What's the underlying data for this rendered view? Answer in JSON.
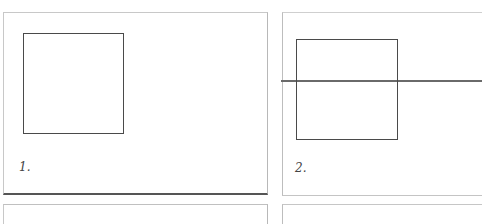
{
  "figure": {
    "panels": [
      {
        "label": "1.",
        "content": "square"
      },
      {
        "label": "2.",
        "content": "square bisected by horizontal line"
      }
    ],
    "colors": {
      "line": "#4a4a4a",
      "border": "#c8c8c8",
      "background": "#ffffff"
    }
  }
}
